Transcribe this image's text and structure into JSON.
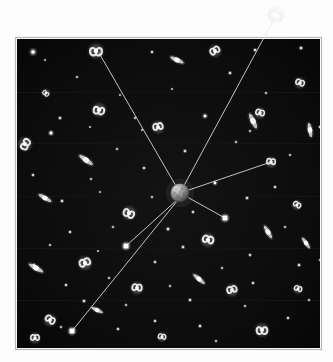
{
  "figure": {
    "background_color": "#ffffff"
  },
  "sky_field": {
    "label": "sky-field",
    "x": 17,
    "y": 39,
    "width": 303,
    "height": 309,
    "fill_color": "#080808",
    "border_color": "#b8b8b8",
    "band_color": "#151515",
    "band_y_positions": [
      92,
      143,
      196,
      248,
      300
    ],
    "vignette_color": "#1a1a1a"
  },
  "center_object": {
    "label": "central-sphere",
    "name": "observer-sphere",
    "cx": 180,
    "cy": 193,
    "r": 9.5,
    "highlight_color": "#d8d8d8",
    "mid_color": "#8c8c8c",
    "shadow_color": "#303030",
    "mottle_color": "#5a5a5a"
  },
  "sight_lines": {
    "label": "sight-lines",
    "color": "#e8e8e8",
    "width": 0.9,
    "lines": [
      {
        "name": "sightline-to-outer-galaxy",
        "x1": 180,
        "y1": 193,
        "x2": 274,
        "y2": 19,
        "target": "galaxy-outside-field"
      },
      {
        "name": "sightline-to-upper-left-galaxy",
        "x1": 180,
        "y1": 193,
        "x2": 99,
        "y2": 53,
        "target": "galaxy-upper-left"
      },
      {
        "name": "sightline-to-right-galaxy",
        "x1": 180,
        "y1": 193,
        "x2": 271,
        "y2": 162,
        "target": "galaxy-right-mid"
      },
      {
        "name": "sightline-to-lower-right-star",
        "x1": 180,
        "y1": 193,
        "x2": 225,
        "y2": 218,
        "target": "star-lower-right"
      },
      {
        "name": "sightline-to-mid-left-star",
        "x1": 178,
        "y1": 199,
        "x2": 126,
        "y2": 246,
        "target": "star-mid-left"
      },
      {
        "name": "sightline-to-lower-left-star",
        "x1": 178,
        "y1": 200,
        "x2": 72,
        "y2": 331,
        "target": "star-lower-left"
      }
    ],
    "endpoint_star_radius": 2.4,
    "endpoint_star_color": "#ffffff"
  },
  "galaxies": {
    "label": "galaxies",
    "spiral_color": "#f0f0f0",
    "core_color": "#ffffff",
    "items": [
      {
        "name": "galaxy-outside-field",
        "x": 276,
        "y": 15,
        "size": 12,
        "type": "spiral",
        "rot": 20,
        "outside_field": true
      },
      {
        "name": "galaxy-upper-left",
        "x": 96,
        "y": 51,
        "size": 11,
        "type": "spiral",
        "rot": 0
      },
      {
        "name": "galaxy-top-mid",
        "x": 215,
        "y": 51,
        "size": 9,
        "type": "spiral",
        "rot": 150
      },
      {
        "name": "galaxy-top-edgeon",
        "x": 177,
        "y": 60,
        "size": 8,
        "type": "edge-on",
        "rot": 25
      },
      {
        "name": "galaxy-upper-left-small",
        "x": 46,
        "y": 93,
        "size": 6,
        "type": "spiral",
        "rot": 40
      },
      {
        "name": "galaxy-upper-right",
        "x": 300,
        "y": 83,
        "size": 8,
        "type": "spiral",
        "rot": 200
      },
      {
        "name": "galaxy-mid-upper-left",
        "x": 99,
        "y": 110,
        "size": 10,
        "type": "spiral",
        "rot": 10
      },
      {
        "name": "galaxy-center-upper",
        "x": 158,
        "y": 127,
        "size": 9,
        "type": "spiral",
        "rot": 170
      },
      {
        "name": "galaxy-right-upper",
        "x": 260,
        "y": 113,
        "size": 8,
        "type": "spiral",
        "rot": 195
      },
      {
        "name": "galaxy-left-mid",
        "x": 25,
        "y": 144,
        "size": 10,
        "type": "spiral",
        "rot": 300
      },
      {
        "name": "galaxy-edgeon-left",
        "x": 86,
        "y": 160,
        "size": 9,
        "type": "edge-on",
        "rot": 35
      },
      {
        "name": "galaxy-edgeon-center",
        "x": 253,
        "y": 121,
        "size": 9,
        "type": "edge-on",
        "rot": 65
      },
      {
        "name": "galaxy-edgeon-right",
        "x": 310,
        "y": 130,
        "size": 8,
        "type": "edge-on",
        "rot": 80
      },
      {
        "name": "galaxy-right-mid",
        "x": 271,
        "y": 162,
        "size": 8,
        "type": "spiral",
        "rot": 185
      },
      {
        "name": "galaxy-edgeon-far-left",
        "x": 45,
        "y": 198,
        "size": 8,
        "type": "edge-on",
        "rot": 30
      },
      {
        "name": "galaxy-lower-left-spiral",
        "x": 129,
        "y": 213,
        "size": 10,
        "type": "spiral",
        "rot": 25
      },
      {
        "name": "galaxy-left-lower-edgeon",
        "x": 36,
        "y": 268,
        "size": 9,
        "type": "edge-on",
        "rot": 30
      },
      {
        "name": "galaxy-mid-lower",
        "x": 85,
        "y": 263,
        "size": 10,
        "type": "spiral",
        "rot": 160
      },
      {
        "name": "galaxy-center-lower",
        "x": 208,
        "y": 240,
        "size": 10,
        "type": "spiral",
        "rot": 195
      },
      {
        "name": "galaxy-lower-right-small",
        "x": 297,
        "y": 205,
        "size": 7,
        "type": "spiral",
        "rot": 210
      },
      {
        "name": "galaxy-edgeon-lower-right",
        "x": 268,
        "y": 232,
        "size": 8,
        "type": "edge-on",
        "rot": 60
      },
      {
        "name": "galaxy-edgeon-mid-lower",
        "x": 199,
        "y": 279,
        "size": 8,
        "type": "edge-on",
        "rot": 40
      },
      {
        "name": "galaxy-lower-left-edge",
        "x": 50,
        "y": 320,
        "size": 9,
        "type": "spiral",
        "rot": 215
      },
      {
        "name": "galaxy-bottom-mid",
        "x": 137,
        "y": 288,
        "size": 9,
        "type": "spiral",
        "rot": 185
      },
      {
        "name": "galaxy-edgeon-bottom-left",
        "x": 97,
        "y": 310,
        "size": 7,
        "type": "edge-on",
        "rot": 25
      },
      {
        "name": "galaxy-bottom-center",
        "x": 232,
        "y": 290,
        "size": 9,
        "type": "spiral",
        "rot": 165
      },
      {
        "name": "galaxy-bottom-right",
        "x": 262,
        "y": 330,
        "size": 10,
        "type": "spiral",
        "rot": 0
      },
      {
        "name": "galaxy-bottom-right-small",
        "x": 298,
        "y": 289,
        "size": 7,
        "type": "spiral",
        "rot": 200
      },
      {
        "name": "galaxy-bottom-far-left",
        "x": 35,
        "y": 338,
        "size": 8,
        "type": "spiral",
        "rot": 180
      },
      {
        "name": "galaxy-bottom-small",
        "x": 162,
        "y": 337,
        "size": 7,
        "type": "spiral",
        "rot": 190
      },
      {
        "name": "galaxy-edgeon-right-far",
        "x": 306,
        "y": 243,
        "size": 7,
        "type": "edge-on",
        "rot": 55
      }
    ]
  },
  "stars": {
    "label": "field-stars",
    "color": "#ffffff",
    "points": [
      {
        "x": 33,
        "y": 52,
        "r": 1.8
      },
      {
        "x": 152,
        "y": 52,
        "r": 0.9
      },
      {
        "x": 255,
        "y": 50,
        "r": 1.0
      },
      {
        "x": 301,
        "y": 48,
        "r": 1.1
      },
      {
        "x": 77,
        "y": 77,
        "r": 0.8
      },
      {
        "x": 230,
        "y": 73,
        "r": 1.0
      },
      {
        "x": 120,
        "y": 95,
        "r": 0.7
      },
      {
        "x": 60,
        "y": 118,
        "r": 1.0
      },
      {
        "x": 205,
        "y": 116,
        "r": 1.3
      },
      {
        "x": 135,
        "y": 118,
        "r": 0.8
      },
      {
        "x": 51,
        "y": 133,
        "r": 1.4
      },
      {
        "x": 142,
        "y": 130,
        "r": 0.7
      },
      {
        "x": 250,
        "y": 131,
        "r": 0.8
      },
      {
        "x": 320,
        "y": 127,
        "r": 0.9
      },
      {
        "x": 117,
        "y": 149,
        "r": 0.8
      },
      {
        "x": 185,
        "y": 151,
        "r": 1.0
      },
      {
        "x": 236,
        "y": 142,
        "r": 0.8
      },
      {
        "x": 33,
        "y": 175,
        "r": 0.9
      },
      {
        "x": 91,
        "y": 179,
        "r": 0.8
      },
      {
        "x": 144,
        "y": 168,
        "r": 0.9
      },
      {
        "x": 215,
        "y": 183,
        "r": 1.2
      },
      {
        "x": 275,
        "y": 187,
        "r": 0.9
      },
      {
        "x": 62,
        "y": 201,
        "r": 1.0
      },
      {
        "x": 100,
        "y": 192,
        "r": 0.7
      },
      {
        "x": 152,
        "y": 197,
        "r": 0.8
      },
      {
        "x": 247,
        "y": 198,
        "r": 1.0
      },
      {
        "x": 193,
        "y": 212,
        "r": 0.9
      },
      {
        "x": 70,
        "y": 232,
        "r": 0.9
      },
      {
        "x": 113,
        "y": 227,
        "r": 0.8
      },
      {
        "x": 168,
        "y": 229,
        "r": 1.1
      },
      {
        "x": 285,
        "y": 227,
        "r": 0.8
      },
      {
        "x": 50,
        "y": 245,
        "r": 0.8
      },
      {
        "x": 183,
        "y": 247,
        "r": 1.0
      },
      {
        "x": 250,
        "y": 255,
        "r": 0.9
      },
      {
        "x": 320,
        "y": 260,
        "r": 0.8
      },
      {
        "x": 34,
        "y": 265,
        "r": 0.9
      },
      {
        "x": 98,
        "y": 251,
        "r": 0.7
      },
      {
        "x": 155,
        "y": 262,
        "r": 0.9
      },
      {
        "x": 222,
        "y": 268,
        "r": 0.8
      },
      {
        "x": 299,
        "y": 265,
        "r": 1.0
      },
      {
        "x": 66,
        "y": 285,
        "r": 0.9
      },
      {
        "x": 109,
        "y": 278,
        "r": 0.8
      },
      {
        "x": 170,
        "y": 286,
        "r": 0.8
      },
      {
        "x": 253,
        "y": 283,
        "r": 0.9
      },
      {
        "x": 84,
        "y": 301,
        "r": 1.0
      },
      {
        "x": 126,
        "y": 305,
        "r": 0.8
      },
      {
        "x": 190,
        "y": 300,
        "r": 1.0
      },
      {
        "x": 245,
        "y": 306,
        "r": 0.8
      },
      {
        "x": 61,
        "y": 327,
        "r": 0.8
      },
      {
        "x": 118,
        "y": 329,
        "r": 0.9
      },
      {
        "x": 155,
        "y": 321,
        "r": 0.9
      },
      {
        "x": 200,
        "y": 326,
        "r": 1.0
      },
      {
        "x": 288,
        "y": 318,
        "r": 0.9
      },
      {
        "x": 309,
        "y": 300,
        "r": 0.8
      },
      {
        "x": 216,
        "y": 341,
        "r": 0.8
      },
      {
        "x": 45,
        "y": 60,
        "r": 0.7
      },
      {
        "x": 266,
        "y": 93,
        "r": 0.8
      },
      {
        "x": 172,
        "y": 89,
        "r": 0.7
      },
      {
        "x": 90,
        "y": 127,
        "r": 0.7
      },
      {
        "x": 290,
        "y": 155,
        "r": 0.8
      }
    ]
  }
}
